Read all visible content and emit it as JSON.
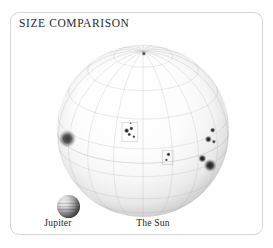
{
  "figure": {
    "title": "SIZE COMPARISON",
    "card_border_color": "#d6d6d6",
    "background_color": "#ffffff",
    "text_color": "#2a2a2a"
  },
  "bodies": [
    {
      "name": "Jupiter",
      "label": "Jupiter",
      "kind": "planet",
      "rendered_diameter_px": 23,
      "center_px": [
        57,
        193
      ]
    },
    {
      "name": "The Sun",
      "label": "The Sun",
      "kind": "star",
      "rendered_diameter_px": 172,
      "center_px": [
        132,
        118
      ],
      "features": {
        "graticule": "latitude-longitude grid with meridians converging at the visible north pole",
        "sunspot_groups": 5
      }
    }
  ],
  "chart_data": {
    "type": "scatter",
    "title": "SIZE COMPARISON",
    "xlabel": "",
    "ylabel": "",
    "categories": [
      "Jupiter",
      "The Sun"
    ],
    "values": [
      23,
      172
    ],
    "units": "rendered disc diameter in pixels",
    "annotations": [
      "Jupiter",
      "The Sun"
    ],
    "grid": true,
    "legend": "none"
  },
  "sun_grid": {
    "meridian_count": 18,
    "parallel_count": 9,
    "line_color": "#b9b9b9"
  },
  "sunspots": [
    {
      "group": 1,
      "cx": 0.405,
      "cy": 0.498,
      "r": 0.016,
      "darkness": 0.92
    },
    {
      "group": 1,
      "cx": 0.432,
      "cy": 0.485,
      "r": 0.013,
      "darkness": 0.88
    },
    {
      "group": 1,
      "cx": 0.42,
      "cy": 0.52,
      "r": 0.012,
      "darkness": 0.85
    },
    {
      "group": 1,
      "cx": 0.447,
      "cy": 0.533,
      "r": 0.01,
      "darkness": 0.8
    },
    {
      "group": 1,
      "cx": 0.428,
      "cy": 0.455,
      "r": 0.008,
      "darkness": 0.62
    },
    {
      "group": 2,
      "cx": 0.06,
      "cy": 0.545,
      "r": 0.052,
      "darkness": 0.78
    },
    {
      "group": 3,
      "cx": 0.905,
      "cy": 0.495,
      "r": 0.016,
      "darkness": 0.88
    },
    {
      "group": 3,
      "cx": 0.88,
      "cy": 0.548,
      "r": 0.021,
      "darkness": 0.9
    },
    {
      "group": 3,
      "cx": 0.912,
      "cy": 0.562,
      "r": 0.013,
      "darkness": 0.74
    },
    {
      "group": 4,
      "cx": 0.648,
      "cy": 0.636,
      "r": 0.013,
      "darkness": 0.86
    },
    {
      "group": 4,
      "cx": 0.636,
      "cy": 0.668,
      "r": 0.01,
      "darkness": 0.72
    },
    {
      "group": 5,
      "cx": 0.845,
      "cy": 0.66,
      "r": 0.024,
      "darkness": 0.92
    },
    {
      "group": 5,
      "cx": 0.89,
      "cy": 0.7,
      "r": 0.038,
      "darkness": 0.88
    },
    {
      "group": 6,
      "cx": 0.505,
      "cy": 0.05,
      "r": 0.014,
      "darkness": 0.7
    }
  ]
}
